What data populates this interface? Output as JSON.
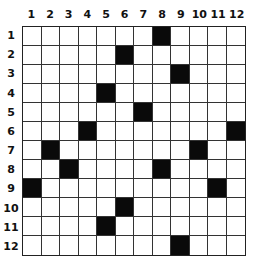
{
  "puzzle": {
    "rows": 12,
    "cols": 12,
    "column_labels": [
      "1",
      "2",
      "3",
      "4",
      "5",
      "6",
      "7",
      "8",
      "9",
      "10",
      "11",
      "12"
    ],
    "row_labels": [
      "1",
      "2",
      "3",
      "4",
      "5",
      "6",
      "7",
      "8",
      "9",
      "10",
      "11",
      "12"
    ],
    "black_cells": [
      {
        "row": 1,
        "col": 8
      },
      {
        "row": 2,
        "col": 6
      },
      {
        "row": 3,
        "col": 9
      },
      {
        "row": 4,
        "col": 5
      },
      {
        "row": 5,
        "col": 7
      },
      {
        "row": 6,
        "col": 4
      },
      {
        "row": 6,
        "col": 12
      },
      {
        "row": 7,
        "col": 2
      },
      {
        "row": 7,
        "col": 10
      },
      {
        "row": 8,
        "col": 3
      },
      {
        "row": 8,
        "col": 8
      },
      {
        "row": 9,
        "col": 1
      },
      {
        "row": 9,
        "col": 11
      },
      {
        "row": 10,
        "col": 6
      },
      {
        "row": 11,
        "col": 5
      },
      {
        "row": 12,
        "col": 9
      }
    ],
    "colors": {
      "filled": "#0a0a0a",
      "empty": "#ffffff",
      "line": "#333333"
    }
  }
}
